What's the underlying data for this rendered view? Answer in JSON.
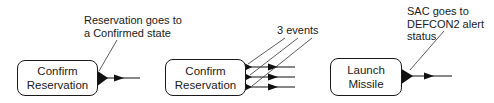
{
  "diagrams": [
    {
      "box": {
        "line1": "Confirm",
        "line2": "Reservation"
      },
      "annotation": {
        "line1": "Reservation goes to",
        "line2": "a Confirmed state"
      }
    },
    {
      "box": {
        "line1": "Confirm",
        "line2": "Reservation"
      },
      "annotation": {
        "line1": "3 events"
      },
      "event_count": 3
    },
    {
      "box": {
        "line1": "Launch",
        "line2": "Missile"
      },
      "annotation": {
        "line1": "SAC goes to",
        "line2": "DEFCON2 alert",
        "line3": "status"
      }
    }
  ]
}
